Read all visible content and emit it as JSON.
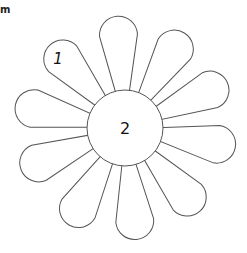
{
  "corner_text": "m",
  "flower": {
    "center": {
      "x": 125,
      "y": 128,
      "r": 38,
      "label": "2"
    },
    "petal_count": 10,
    "petal_label": "1",
    "petal_angles": [
      -94,
      -58,
      -24,
      10,
      48,
      84,
      120,
      158,
      192,
      228
    ],
    "stroke_color": "#555555",
    "fill_color": "#ffffff"
  }
}
